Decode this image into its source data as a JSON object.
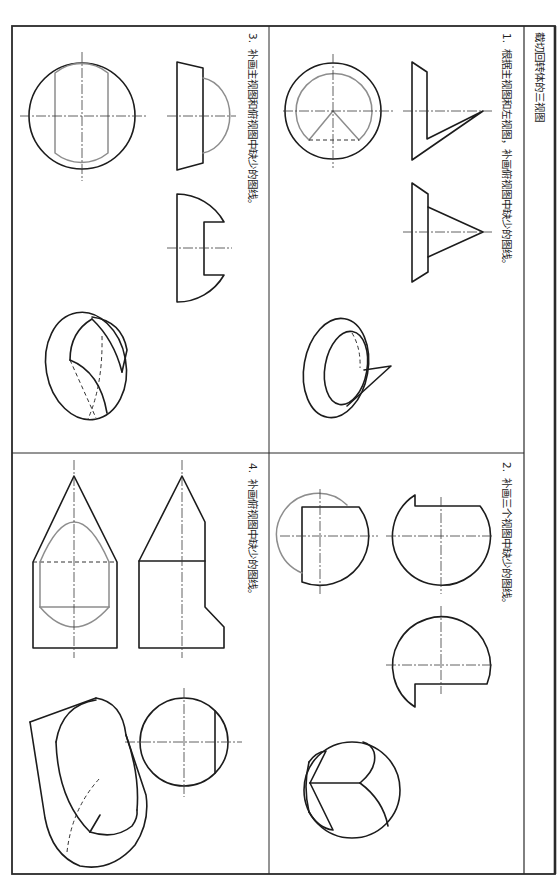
{
  "worksheet": {
    "title": "截切回转体的三视图",
    "colors": {
      "outline": "#1c1c1c",
      "added": "#8d8d8d",
      "centerline": "#3a3a3a",
      "frame": "#2a2a2a",
      "text": "#222222",
      "background": "#ffffff"
    },
    "tasks": [
      {
        "number": "1.",
        "instruction": "根据主视图和左视图，补画俯视图中缺少的图线。",
        "views": [
          "top-view",
          "front-view",
          "left-view",
          "pictorial"
        ]
      },
      {
        "number": "2.",
        "instruction": "补画三个视图中缺少的图线。",
        "views": [
          "view-1",
          "view-2",
          "view-3",
          "pictorial"
        ]
      },
      {
        "number": "3.",
        "instruction": "补画主视图和俯视图中缺少的图线。",
        "views": [
          "top-view",
          "front-view",
          "left-view",
          "pictorial"
        ]
      },
      {
        "number": "4.",
        "instruction": "补画俯视图中缺少的图线。",
        "views": [
          "top-view",
          "front-view",
          "left-view",
          "pictorial"
        ]
      }
    ]
  }
}
